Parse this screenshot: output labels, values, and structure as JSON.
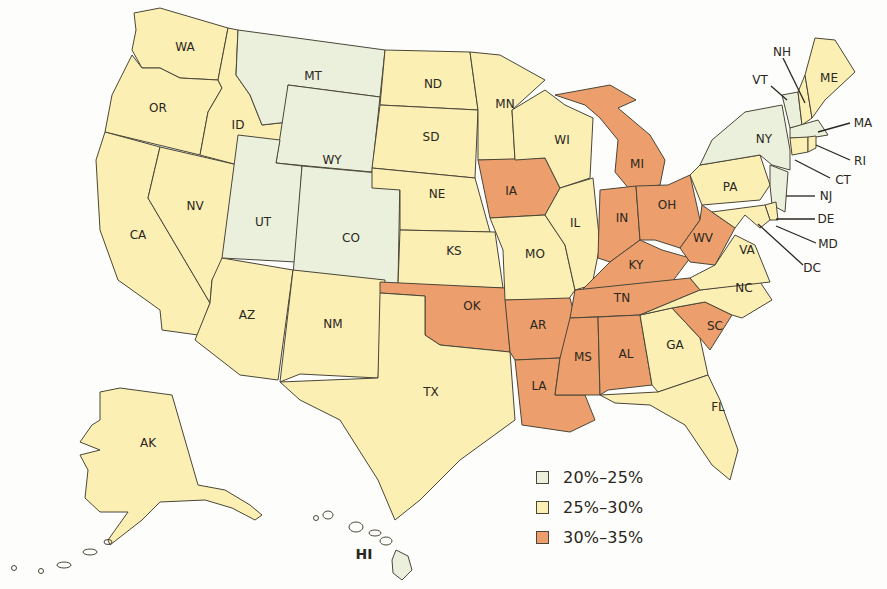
{
  "legend": {
    "items": [
      {
        "label": "20%–25%",
        "color": "#eaf0dc"
      },
      {
        "label": "25%–30%",
        "color": "#fbefb4"
      },
      {
        "label": "30%–35%",
        "color": "#ec9f6c"
      }
    ]
  },
  "states": {
    "WA": {
      "label": "WA",
      "bin": "25%–30%"
    },
    "OR": {
      "label": "OR",
      "bin": "25%–30%"
    },
    "CA": {
      "label": "CA",
      "bin": "25%–30%"
    },
    "ID": {
      "label": "ID",
      "bin": "25%–30%"
    },
    "NV": {
      "label": "NV",
      "bin": "25%–30%"
    },
    "AZ": {
      "label": "AZ",
      "bin": "25%–30%"
    },
    "MT": {
      "label": "MT",
      "bin": "20%–25%"
    },
    "WY": {
      "label": "WY",
      "bin": "20%–25%"
    },
    "UT": {
      "label": "UT",
      "bin": "20%–25%"
    },
    "CO": {
      "label": "CO",
      "bin": "20%–25%"
    },
    "NM": {
      "label": "NM",
      "bin": "25%–30%"
    },
    "ND": {
      "label": "ND",
      "bin": "25%–30%"
    },
    "SD": {
      "label": "SD",
      "bin": "25%–30%"
    },
    "NE": {
      "label": "NE",
      "bin": "25%–30%"
    },
    "KS": {
      "label": "KS",
      "bin": "25%–30%"
    },
    "OK": {
      "label": "OK",
      "bin": "30%–35%"
    },
    "TX": {
      "label": "TX",
      "bin": "25%–30%"
    },
    "MN": {
      "label": "MN",
      "bin": "25%–30%"
    },
    "IA": {
      "label": "IA",
      "bin": "30%–35%"
    },
    "MO": {
      "label": "MO",
      "bin": "25%–30%"
    },
    "AR": {
      "label": "AR",
      "bin": "30%–35%"
    },
    "LA": {
      "label": "LA",
      "bin": "30%–35%"
    },
    "WI": {
      "label": "WI",
      "bin": "25%–30%"
    },
    "IL": {
      "label": "IL",
      "bin": "25%–30%"
    },
    "MI": {
      "label": "MI",
      "bin": "30%–35%"
    },
    "IN": {
      "label": "IN",
      "bin": "30%–35%"
    },
    "OH": {
      "label": "OH",
      "bin": "30%–35%"
    },
    "KY": {
      "label": "KY",
      "bin": "30%–35%"
    },
    "TN": {
      "label": "TN",
      "bin": "30%–35%"
    },
    "MS": {
      "label": "MS",
      "bin": "30%–35%"
    },
    "AL": {
      "label": "AL",
      "bin": "30%–35%"
    },
    "GA": {
      "label": "GA",
      "bin": "25%–30%"
    },
    "FL": {
      "label": "FL",
      "bin": "25%–30%"
    },
    "SC": {
      "label": "SC",
      "bin": "30%–35%"
    },
    "NC": {
      "label": "NC",
      "bin": "25%–30%"
    },
    "VA": {
      "label": "VA",
      "bin": "25%–30%"
    },
    "WV": {
      "label": "WV",
      "bin": "30%–35%"
    },
    "PA": {
      "label": "PA",
      "bin": "25%–30%"
    },
    "NY": {
      "label": "NY",
      "bin": "20%–25%"
    },
    "VT": {
      "label": "VT",
      "bin": "20%–25%"
    },
    "NH": {
      "label": "NH",
      "bin": "25%–30%"
    },
    "ME": {
      "label": "ME",
      "bin": "25%–30%"
    },
    "MA": {
      "label": "MA",
      "bin": "20%–25%"
    },
    "RI": {
      "label": "RI",
      "bin": "25%–30%"
    },
    "CT": {
      "label": "CT",
      "bin": "25%–30%"
    },
    "NJ": {
      "label": "NJ",
      "bin": "20%–25%"
    },
    "DE": {
      "label": "DE",
      "bin": "25%–30%"
    },
    "MD": {
      "label": "MD",
      "bin": "25%–30%"
    },
    "DC": {
      "label": "DC",
      "bin": "25%–30%"
    },
    "AK": {
      "label": "AK",
      "bin": "25%–30%"
    },
    "HI": {
      "label": "HI",
      "bin": "20%–25%"
    }
  }
}
